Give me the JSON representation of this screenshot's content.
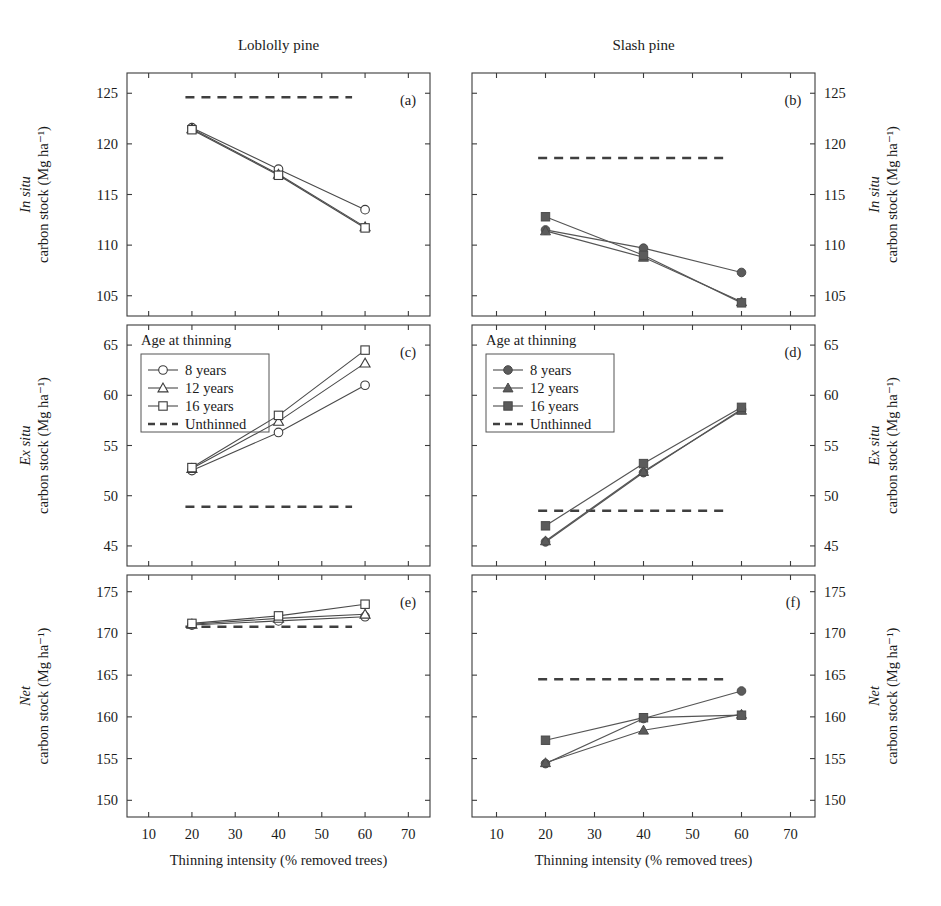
{
  "figure": {
    "column_titles": [
      "Loblolly pine",
      "Slash pine"
    ],
    "xlabel": "Thinning intensity (% removed trees)",
    "x_ticks": [
      10,
      20,
      30,
      40,
      50,
      60,
      70
    ],
    "xlim": [
      5,
      75
    ],
    "panel_letters": [
      "(a)",
      "(b)",
      "(c)",
      "(d)",
      "(e)",
      "(f)"
    ],
    "legend_title": "Age at thinning",
    "legend_labels": [
      "8 years",
      "12 years",
      "16 years",
      "Unthinned"
    ],
    "marker_shapes": [
      "circle",
      "triangle",
      "square",
      "dashed"
    ],
    "colors": {
      "line": "#4a4a4a",
      "frame": "#3b3b3b",
      "marker_fill_open": "#ffffff",
      "marker_fill_solid": "#5b5b5b",
      "dashed": "#3f3f3f",
      "text": "#1a1a1a"
    },
    "row_axis_titles": [
      {
        "emph": "In situ",
        "rest": "carbon stock (Mg ha⁻¹)"
      },
      {
        "emph": "Ex situ",
        "rest": "carbon stock (Mg ha⁻¹)"
      },
      {
        "emph": "Net",
        "rest": "carbon stock (Mg ha⁻¹)"
      }
    ]
  },
  "chart_data": [
    {
      "panel": "(a)",
      "type": "line",
      "title": "Loblolly pine",
      "row": "In situ carbon stock",
      "xlabel": "Thinning intensity (% removed trees)",
      "ylabel": "In situ carbon stock (Mg ha⁻¹)",
      "x": [
        20,
        40,
        60
      ],
      "xlim": [
        5,
        75
      ],
      "ylim": [
        103,
        127
      ],
      "yticks": [
        105,
        110,
        115,
        120,
        125
      ],
      "grid": false,
      "legend": "in panel (c)",
      "series": [
        {
          "name": "8 years",
          "marker": "open-circle",
          "values": [
            121.6,
            117.5,
            113.5
          ]
        },
        {
          "name": "12 years",
          "marker": "open-triangle",
          "values": [
            121.5,
            117.0,
            111.8
          ]
        },
        {
          "name": "16 years",
          "marker": "open-square",
          "values": [
            121.4,
            116.9,
            111.7
          ]
        },
        {
          "name": "Unthinned",
          "marker": "dashed-line",
          "values": [
            124.6,
            124.6,
            124.6
          ]
        }
      ]
    },
    {
      "panel": "(b)",
      "type": "line",
      "title": "Slash pine",
      "row": "In situ carbon stock",
      "xlabel": "Thinning intensity (% removed trees)",
      "ylabel": "In situ carbon stock (Mg ha⁻¹)",
      "x": [
        20,
        40,
        60
      ],
      "xlim": [
        5,
        75
      ],
      "ylim": [
        103,
        127
      ],
      "yticks": [
        105,
        110,
        115,
        120,
        125
      ],
      "grid": false,
      "legend": "in panel (d)",
      "series": [
        {
          "name": "8 years",
          "marker": "filled-circle",
          "values": [
            111.5,
            109.7,
            107.3
          ]
        },
        {
          "name": "12 years",
          "marker": "filled-triangle",
          "values": [
            111.4,
            108.8,
            104.4
          ]
        },
        {
          "name": "16 years",
          "marker": "filled-square",
          "values": [
            112.8,
            109.0,
            104.3
          ]
        },
        {
          "name": "Unthinned",
          "marker": "dashed-line",
          "values": [
            118.6,
            118.6,
            118.6
          ]
        }
      ]
    },
    {
      "panel": "(c)",
      "type": "line",
      "title": "Loblolly pine",
      "row": "Ex situ carbon stock",
      "xlabel": "Thinning intensity (% removed trees)",
      "ylabel": "Ex situ carbon stock (Mg ha⁻¹)",
      "x": [
        20,
        40,
        60
      ],
      "xlim": [
        5,
        75
      ],
      "ylim": [
        43,
        67
      ],
      "yticks": [
        45,
        50,
        55,
        60,
        65
      ],
      "grid": false,
      "legend": "Age at thinning",
      "series": [
        {
          "name": "8 years",
          "marker": "open-circle",
          "values": [
            52.5,
            56.3,
            61.0
          ]
        },
        {
          "name": "12 years",
          "marker": "open-triangle",
          "values": [
            52.7,
            57.4,
            63.2
          ]
        },
        {
          "name": "16 years",
          "marker": "open-square",
          "values": [
            52.8,
            58.0,
            64.5
          ]
        },
        {
          "name": "Unthinned",
          "marker": "dashed-line",
          "values": [
            48.9,
            48.9,
            48.9
          ]
        }
      ]
    },
    {
      "panel": "(d)",
      "type": "line",
      "title": "Slash pine",
      "row": "Ex situ carbon stock",
      "xlabel": "Thinning intensity (% removed trees)",
      "ylabel": "Ex situ carbon stock (Mg ha⁻¹)",
      "x": [
        20,
        40,
        60
      ],
      "xlim": [
        5,
        75
      ],
      "ylim": [
        43,
        67
      ],
      "yticks": [
        45,
        50,
        55,
        60,
        65
      ],
      "grid": false,
      "legend": "Age at thinning",
      "series": [
        {
          "name": "8 years",
          "marker": "filled-circle",
          "values": [
            45.4,
            52.3,
            58.6
          ]
        },
        {
          "name": "12 years",
          "marker": "filled-triangle",
          "values": [
            45.5,
            52.4,
            58.5
          ]
        },
        {
          "name": "16 years",
          "marker": "filled-square",
          "values": [
            47.0,
            53.2,
            58.8
          ]
        },
        {
          "name": "Unthinned",
          "marker": "dashed-line",
          "values": [
            48.5,
            48.5,
            48.5
          ]
        }
      ]
    },
    {
      "panel": "(e)",
      "type": "line",
      "title": "Loblolly pine",
      "row": "Net carbon stock",
      "xlabel": "Thinning intensity (% removed trees)",
      "ylabel": "Net carbon stock (Mg ha⁻¹)",
      "x": [
        20,
        40,
        60
      ],
      "xlim": [
        5,
        75
      ],
      "ylim": [
        148,
        177
      ],
      "yticks": [
        150,
        155,
        160,
        165,
        170,
        175
      ],
      "grid": false,
      "legend": "in panel (c)",
      "series": [
        {
          "name": "8 years",
          "marker": "open-circle",
          "values": [
            171.0,
            171.5,
            172.0
          ]
        },
        {
          "name": "12 years",
          "marker": "open-triangle",
          "values": [
            171.1,
            171.8,
            172.3
          ]
        },
        {
          "name": "16 years",
          "marker": "open-square",
          "values": [
            171.2,
            172.1,
            173.5
          ]
        },
        {
          "name": "Unthinned",
          "marker": "dashed-line",
          "values": [
            170.8,
            170.8,
            170.8
          ]
        }
      ]
    },
    {
      "panel": "(f)",
      "type": "line",
      "title": "Slash pine",
      "row": "Net carbon stock",
      "xlabel": "Thinning intensity (% removed trees)",
      "ylabel": "Net carbon stock (Mg ha⁻¹)",
      "x": [
        20,
        40,
        60
      ],
      "xlim": [
        5,
        75
      ],
      "ylim": [
        148,
        177
      ],
      "yticks": [
        150,
        155,
        160,
        165,
        170,
        175
      ],
      "grid": false,
      "legend": "Age at thinning",
      "series": [
        {
          "name": "8 years",
          "marker": "filled-circle",
          "values": [
            154.4,
            159.8,
            163.1
          ]
        },
        {
          "name": "12 years",
          "marker": "filled-triangle",
          "values": [
            154.5,
            158.4,
            160.3
          ]
        },
        {
          "name": "16 years",
          "marker": "filled-square",
          "values": [
            157.2,
            159.9,
            160.2
          ]
        },
        {
          "name": "Unthinned",
          "marker": "dashed-line",
          "values": [
            164.5,
            164.5,
            164.5
          ]
        }
      ]
    }
  ]
}
